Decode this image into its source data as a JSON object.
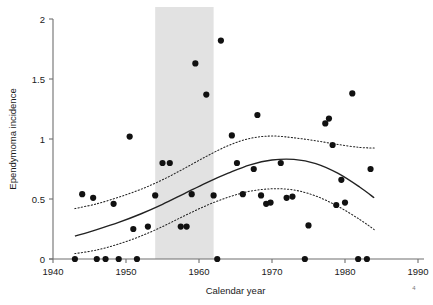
{
  "chart_data": {
    "type": "scatter",
    "title": "",
    "xlabel": "Calendar year",
    "ylabel": "Ependymoma incidence",
    "xlim": [
      1940,
      1990
    ],
    "ylim": [
      0,
      2
    ],
    "xticks": [
      1940,
      1950,
      1960,
      1970,
      1980,
      1990
    ],
    "xtick_labels": [
      "1940",
      "1950",
      "1960",
      "1970",
      "1980",
      "1990"
    ],
    "yticks": [
      0,
      0.5,
      1,
      1.5,
      2
    ],
    "ytick_labels": [
      "0",
      "0.5",
      "1",
      "1.5",
      "2"
    ],
    "grid": false,
    "legend": "none",
    "marker": "filled-circle",
    "marker_color": "#111111",
    "shaded_band": {
      "label": "highlighted period",
      "x_start": 1954,
      "x_end": 1962,
      "color": "#e2e2e2"
    },
    "points": [
      {
        "x": 1943.0,
        "y": 0.0
      },
      {
        "x": 1944.0,
        "y": 0.54
      },
      {
        "x": 1945.5,
        "y": 0.51
      },
      {
        "x": 1946.0,
        "y": 0.0
      },
      {
        "x": 1947.2,
        "y": 0.0
      },
      {
        "x": 1948.3,
        "y": 0.46
      },
      {
        "x": 1949.0,
        "y": 0.0
      },
      {
        "x": 1950.5,
        "y": 1.02
      },
      {
        "x": 1951.0,
        "y": 0.25
      },
      {
        "x": 1951.5,
        "y": 0.0
      },
      {
        "x": 1953.0,
        "y": 0.27
      },
      {
        "x": 1954.0,
        "y": 0.53
      },
      {
        "x": 1955.0,
        "y": 0.8
      },
      {
        "x": 1956.0,
        "y": 0.8
      },
      {
        "x": 1957.5,
        "y": 0.27
      },
      {
        "x": 1958.3,
        "y": 0.27
      },
      {
        "x": 1959.0,
        "y": 0.54
      },
      {
        "x": 1959.5,
        "y": 1.63
      },
      {
        "x": 1961.0,
        "y": 1.37
      },
      {
        "x": 1962.0,
        "y": 0.53
      },
      {
        "x": 1962.5,
        "y": 0.0
      },
      {
        "x": 1963.0,
        "y": 1.82
      },
      {
        "x": 1964.5,
        "y": 1.03
      },
      {
        "x": 1965.2,
        "y": 0.8
      },
      {
        "x": 1966.0,
        "y": 0.54
      },
      {
        "x": 1967.5,
        "y": 0.75
      },
      {
        "x": 1968.0,
        "y": 1.2
      },
      {
        "x": 1968.5,
        "y": 0.53
      },
      {
        "x": 1969.2,
        "y": 0.46
      },
      {
        "x": 1969.8,
        "y": 0.47
      },
      {
        "x": 1971.2,
        "y": 0.8
      },
      {
        "x": 1972.0,
        "y": 0.51
      },
      {
        "x": 1972.8,
        "y": 0.52
      },
      {
        "x": 1974.5,
        "y": 0.0
      },
      {
        "x": 1975.0,
        "y": 0.28
      },
      {
        "x": 1977.3,
        "y": 1.13
      },
      {
        "x": 1977.8,
        "y": 1.17
      },
      {
        "x": 1978.3,
        "y": 0.95
      },
      {
        "x": 1978.8,
        "y": 0.45
      },
      {
        "x": 1979.5,
        "y": 0.66
      },
      {
        "x": 1980.0,
        "y": 0.47
      },
      {
        "x": 1981.0,
        "y": 1.38
      },
      {
        "x": 1981.8,
        "y": 0.0
      },
      {
        "x": 1983.0,
        "y": 0.0
      },
      {
        "x": 1983.5,
        "y": 0.75
      }
    ],
    "fit_curve": {
      "name": "fitted trend",
      "style": "solid",
      "color": "#222222",
      "x": [
        1943,
        1946,
        1949,
        1952,
        1955,
        1958,
        1961,
        1964,
        1967,
        1970,
        1973,
        1976,
        1979,
        1982,
        1984
      ],
      "y": [
        0.19,
        0.245,
        0.305,
        0.375,
        0.455,
        0.545,
        0.635,
        0.715,
        0.785,
        0.825,
        0.83,
        0.795,
        0.715,
        0.6,
        0.51
      ]
    },
    "confidence_bands": [
      {
        "name": "upper confidence limit",
        "style": "dotted",
        "color": "#222222",
        "x": [
          1943,
          1946,
          1949,
          1952,
          1955,
          1958,
          1961,
          1964,
          1967,
          1970,
          1973,
          1976,
          1979,
          1982,
          1984
        ],
        "y": [
          0.42,
          0.46,
          0.515,
          0.58,
          0.66,
          0.755,
          0.855,
          0.945,
          1.005,
          1.025,
          1.01,
          0.985,
          0.955,
          0.93,
          0.925
        ]
      },
      {
        "name": "lower confidence limit",
        "style": "dotted",
        "color": "#222222",
        "x": [
          1943,
          1946,
          1949,
          1952,
          1955,
          1958,
          1961,
          1964,
          1967,
          1970,
          1973,
          1976,
          1979,
          1982,
          1984
        ],
        "y": [
          0.045,
          0.075,
          0.125,
          0.19,
          0.27,
          0.36,
          0.445,
          0.515,
          0.565,
          0.585,
          0.575,
          0.525,
          0.44,
          0.33,
          0.245
        ]
      }
    ],
    "corner_mark": "4"
  }
}
